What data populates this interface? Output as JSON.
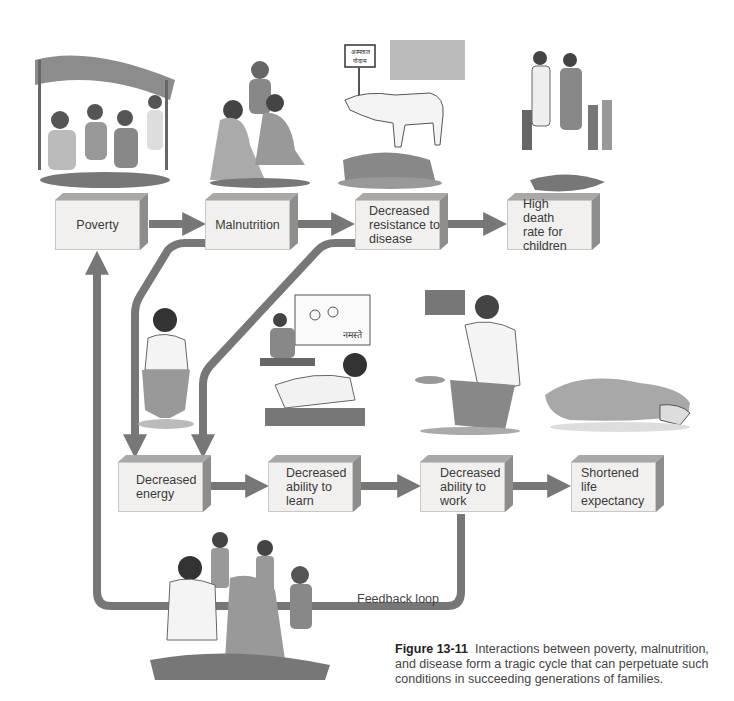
{
  "diagram": {
    "top_row": [
      {
        "id": "poverty",
        "label": "Poverty"
      },
      {
        "id": "malnutrition",
        "label": "Malnutrition"
      },
      {
        "id": "decreased_resistance",
        "label": "Decreased resistance to disease"
      },
      {
        "id": "high_death_rate",
        "label": "High death rate for children"
      }
    ],
    "bottom_row": [
      {
        "id": "decreased_energy",
        "label": "Decreased energy"
      },
      {
        "id": "decreased_ability_learn",
        "label": "Decreased ability to learn"
      },
      {
        "id": "decreased_ability_work",
        "label": "Decreased ability to work"
      },
      {
        "id": "shortened_life",
        "label": "Shortened life expectancy"
      }
    ],
    "edges": [
      [
        "poverty",
        "malnutrition"
      ],
      [
        "malnutrition",
        "decreased_resistance"
      ],
      [
        "decreased_resistance",
        "high_death_rate"
      ],
      [
        "malnutrition",
        "decreased_energy"
      ],
      [
        "decreased_resistance",
        "decreased_energy"
      ],
      [
        "decreased_energy",
        "decreased_ability_learn"
      ],
      [
        "decreased_ability_learn",
        "decreased_ability_work"
      ],
      [
        "decreased_ability_work",
        "shortened_life"
      ],
      [
        "decreased_ability_work",
        "poverty"
      ]
    ],
    "feedback_label": "Feedback loop",
    "colors": {
      "arrow": "#777777",
      "box_front": "#f1f0ee",
      "box_top": "#a9a8a6",
      "box_side": "#8e8d8b"
    }
  },
  "illustrations": [
    {
      "name": "poverty-scene",
      "description": "family under makeshift shelter"
    },
    {
      "name": "malnutrition-scene",
      "description": "emaciated people eating from ground"
    },
    {
      "name": "disease-scene",
      "description": "child lying on mat beside cow and street sign"
    },
    {
      "name": "death-scene",
      "description": "family standing over covered body"
    },
    {
      "name": "energy-scene",
      "description": "listless boy sitting"
    },
    {
      "name": "learning-scene",
      "description": "children struggling at school"
    },
    {
      "name": "work-scene",
      "description": "man begging with bowl"
    },
    {
      "name": "life-expectancy-scene",
      "description": "covered body on ground"
    },
    {
      "name": "family-scene",
      "description": "malnourished family group"
    }
  ],
  "sign_text": "अस्पताल गोदाम",
  "chalkboard_text": "नमस्ते",
  "caption": {
    "figure_label": "Figure 13-11",
    "text": "Interactions between poverty, malnutrition, and disease form a tragic cycle that can perpetuate such conditions in succeeding generations of families."
  }
}
